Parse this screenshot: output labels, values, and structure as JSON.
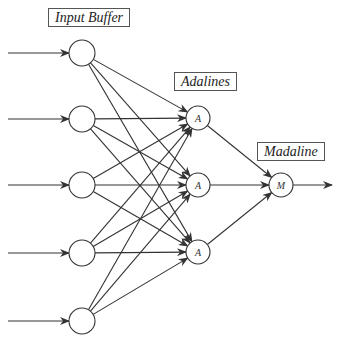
{
  "diagram": {
    "labels": {
      "input_buffer": "Input Buffer",
      "adalines": "Adalines",
      "madaline": "Madaline"
    },
    "input_nodes": [
      {
        "x": 82,
        "y": 53
      },
      {
        "x": 82,
        "y": 119
      },
      {
        "x": 82,
        "y": 185
      },
      {
        "x": 82,
        "y": 253
      },
      {
        "x": 82,
        "y": 321
      }
    ],
    "adaline_nodes": [
      {
        "x": 198,
        "y": 118,
        "label": "A"
      },
      {
        "x": 198,
        "y": 185,
        "label": "A"
      },
      {
        "x": 198,
        "y": 252,
        "label": "A"
      }
    ],
    "madaline_node": {
      "x": 281,
      "y": 185,
      "label": "M"
    },
    "stroke_color": "#333333"
  }
}
